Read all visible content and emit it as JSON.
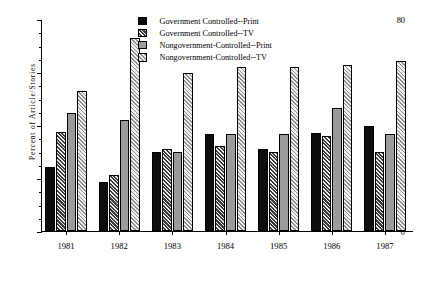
{
  "chart_data": {
    "type": "bar",
    "title": "",
    "xlabel": "",
    "ylabel": "Percent  of  Article/Stories",
    "ylim": [
      0,
      80
    ],
    "ytick_labels": [
      "0",
      "20",
      "40",
      "60",
      "80"
    ],
    "ytick_values": [
      0,
      20,
      40,
      60,
      80
    ],
    "yminor_step": 5,
    "grid": false,
    "legend_position": "top-center",
    "categories": [
      "1981",
      "1982",
      "1983",
      "1984",
      "1985",
      "1986",
      "1987"
    ],
    "series": [
      {
        "name": "Government Controlled--Print",
        "swatch": "solid-black",
        "values": [
          24,
          18.5,
          30,
          36.5,
          31,
          37,
          39.5
        ]
      },
      {
        "name": "Government Controlled--TV",
        "swatch": "dark-hatch",
        "values": [
          37.5,
          21,
          31,
          32,
          30,
          36,
          30
        ]
      },
      {
        "name": "Nongovernment-Controlled--Print",
        "swatch": "solid-gray",
        "values": [
          44.5,
          42,
          30,
          36.5,
          36.5,
          46.5,
          36.5
        ]
      },
      {
        "name": "Nongovernment-Controlled--TV",
        "swatch": "light-hatch",
        "values": [
          53,
          73,
          59.5,
          62,
          62,
          62.5,
          64
        ]
      }
    ],
    "colors": {
      "series0": "#0d0d0d",
      "series1": "#3a3a3a",
      "series2": "#9b9b9b",
      "series3": "#f2f2f2",
      "axis": "#000000",
      "background": "#ffffff"
    }
  }
}
